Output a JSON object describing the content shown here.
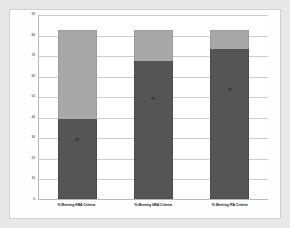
{
  "chart_data": {
    "type": "bar",
    "subtype": "stacked-bar",
    "title": "",
    "xlabel": "",
    "ylabel": "",
    "ylim": [
      0,
      90
    ],
    "yticks": [
      90,
      80,
      70,
      60,
      50,
      40,
      30,
      20,
      10,
      0
    ],
    "ytick_labels": [
      "90",
      "80",
      "70",
      "60",
      "50",
      "40",
      "30",
      "20",
      "10",
      "0"
    ],
    "grid": true,
    "legend": "none",
    "categories": [
      "% Meeting KBA Criteria",
      "% Meeting SBA Criteria",
      "% Meeting IPA Criteria"
    ],
    "series": [
      {
        "name": "Meeting criteria",
        "color": "#555555",
        "values": [
          39,
          67,
          73
        ],
        "data_labels": [
          "39",
          "67",
          "73"
        ]
      },
      {
        "name": "Remainder",
        "color": "#a8a8a8",
        "values": [
          43,
          15,
          9
        ],
        "data_labels": [
          "",
          "",
          ""
        ]
      }
    ],
    "stack_totals": [
      82,
      82,
      82
    ],
    "colors": {
      "dark_segment": "#555555",
      "light_segment": "#a8a8a8",
      "plot_background": "#ffffff",
      "page_background": "#e8e8e8",
      "gridline": "#cccccc",
      "axis": "#b9b9b9"
    }
  }
}
